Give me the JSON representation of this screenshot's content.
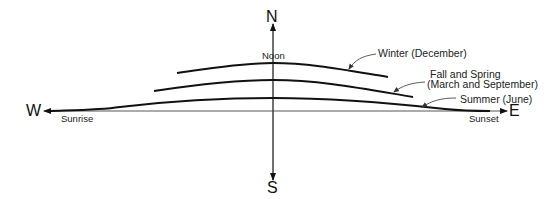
{
  "diagram": {
    "directions": {
      "north": "N",
      "south": "S",
      "west": "W",
      "east": "E"
    },
    "markers": {
      "noon": "Noon",
      "sunrise": "Sunrise",
      "sunset": "Sunset"
    },
    "paths": [
      {
        "id": "winter",
        "label": "Winter (December)"
      },
      {
        "id": "equinox",
        "label_line1": "Fall and Spring",
        "label_line2": "(March and September)"
      },
      {
        "id": "summer",
        "label": "Summer (June)"
      }
    ],
    "colors": {
      "line": "#111111",
      "text": "#222222",
      "background": "#ffffff"
    }
  }
}
